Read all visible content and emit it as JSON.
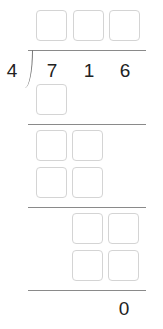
{
  "problem": {
    "divisor": "4",
    "dividend_digits": [
      "7",
      "1",
      "6"
    ],
    "quotient_boxes": 3,
    "remainder": "0"
  },
  "steps": [
    {
      "row": "product-1",
      "boxes": 1
    },
    {
      "row": "difference-1",
      "boxes": 2
    },
    {
      "row": "product-2",
      "boxes": 2
    },
    {
      "row": "difference-2",
      "boxes": 2
    },
    {
      "row": "product-3",
      "boxes": 2
    }
  ]
}
